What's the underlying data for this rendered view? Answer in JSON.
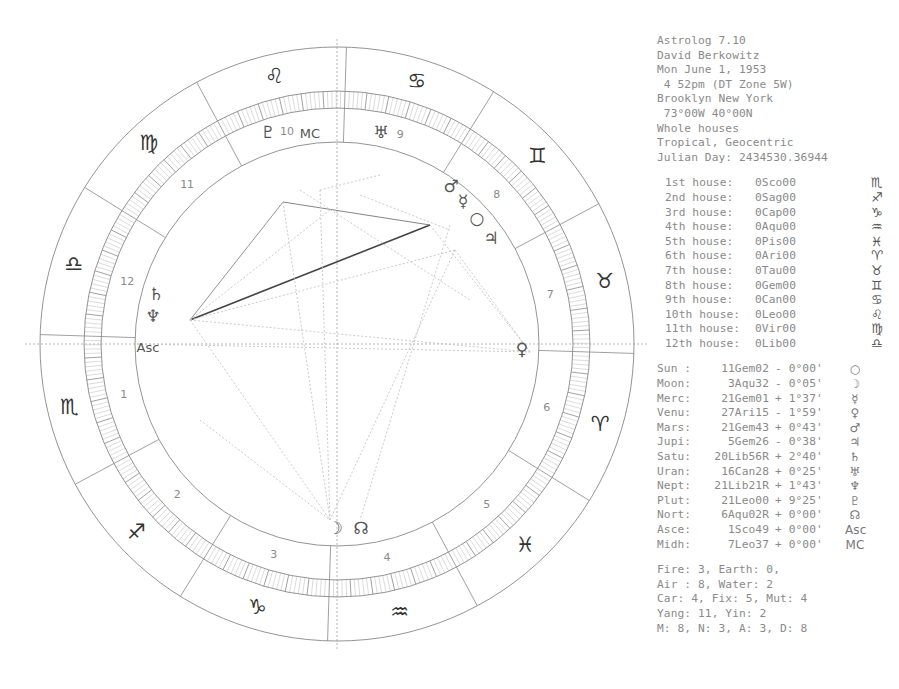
{
  "header": {
    "program": "Astrolog 7.10",
    "name": "David Berkowitz",
    "date": "Mon June 1, 1953",
    "time": " 4 52pm (DT Zone 5W)",
    "place": "Brooklyn New York",
    "coords": " 73°00W 40°00N",
    "house_system": "Whole houses",
    "zodiac": "Tropical, Geocentric",
    "julian_day": "Julian Day: 2434530.36944"
  },
  "houses": [
    {
      "label": "1st house:",
      "cusp": "0Sco00",
      "glyph": "♏"
    },
    {
      "label": "2nd house:",
      "cusp": "0Sag00",
      "glyph": "♐"
    },
    {
      "label": "3rd house:",
      "cusp": "0Cap00",
      "glyph": "♑"
    },
    {
      "label": "4th house:",
      "cusp": "0Aqu00",
      "glyph": "♒"
    },
    {
      "label": "5th house:",
      "cusp": "0Pis00",
      "glyph": "♓"
    },
    {
      "label": "6th house:",
      "cusp": "0Ari00",
      "glyph": "♈"
    },
    {
      "label": "7th house:",
      "cusp": "0Tau00",
      "glyph": "♉"
    },
    {
      "label": "8th house:",
      "cusp": "0Gem00",
      "glyph": "♊"
    },
    {
      "label": "9th house:",
      "cusp": "0Can00",
      "glyph": "♋"
    },
    {
      "label": "10th house:",
      "cusp": "0Leo00",
      "glyph": "♌"
    },
    {
      "label": "11th house:",
      "cusp": "0Vir00",
      "glyph": "♍"
    },
    {
      "label": "12th house:",
      "cusp": "0Lib00",
      "glyph": "♎"
    }
  ],
  "planets": [
    {
      "name": "Sun :",
      "pos": "11Gem02",
      "lat": "- 0°00'",
      "glyph": "○",
      "lon": 71.03
    },
    {
      "name": "Moon:",
      "pos": "3Aqu32",
      "lat": "- 0°05'",
      "glyph": "☽",
      "lon": 303.53
    },
    {
      "name": "Merc:",
      "pos": "21Gem01",
      "lat": "+ 1°37'",
      "glyph": "☿",
      "lon": 81.02
    },
    {
      "name": "Venu:",
      "pos": "27Ari15",
      "lat": "- 1°59'",
      "glyph": "♀",
      "lon": 27.25
    },
    {
      "name": "Mars:",
      "pos": "21Gem43",
      "lat": "+ 0°43'",
      "glyph": "♂",
      "lon": 81.72
    },
    {
      "name": "Jupi:",
      "pos": "5Gem26",
      "lat": "- 0°38'",
      "glyph": "♃",
      "lon": 65.43
    },
    {
      "name": "Satu:",
      "pos": "20Lib56R",
      "lat": "+ 2°40'",
      "glyph": "♄",
      "lon": 200.93
    },
    {
      "name": "Uran:",
      "pos": "16Can28",
      "lat": "+ 0°25'",
      "glyph": "♅",
      "lon": 106.47
    },
    {
      "name": "Nept:",
      "pos": "21Lib21R",
      "lat": "+ 1°43'",
      "glyph": "♆",
      "lon": 201.35
    },
    {
      "name": "Plut:",
      "pos": "21Leo00",
      "lat": "+ 9°25'",
      "glyph": "♇",
      "lon": 141.0
    },
    {
      "name": "Nort:",
      "pos": "6Aqu02R",
      "lat": "+ 0°00'",
      "glyph": "☊",
      "lon": 306.03
    },
    {
      "name": "Asce:",
      "pos": "1Sco49",
      "lat": "+ 0°00'",
      "glyph": "Asc",
      "lon": 211.82
    },
    {
      "name": "Midh:",
      "pos": "7Leo37",
      "lat": "+ 0°00'",
      "glyph": "MC",
      "lon": 127.62
    }
  ],
  "summary": [
    "Fire: 3, Earth: 0,",
    "Air : 8, Water: 2",
    "Car: 4, Fix: 5, Mut: 4",
    "Yang: 11, Yin: 2",
    "M: 8, N: 3, A: 3, D: 8"
  ],
  "wheel": {
    "center": [
      337,
      344
    ],
    "ascendant_lon": 211.82,
    "radii": {
      "outer": 297,
      "band_outer": 253,
      "band_inner": 236,
      "inner": 202
    },
    "signs": [
      "♈",
      "♉",
      "♊",
      "♋",
      "♌",
      "♍",
      "♎",
      "♏",
      "♐",
      "♑",
      "♒",
      "♓"
    ],
    "house_numbers": [
      "1",
      "2",
      "3",
      "4",
      "5",
      "6",
      "7",
      "8",
      "9",
      "10",
      "11",
      "12"
    ],
    "chart_glyphs": [
      {
        "glyph": "♇",
        "x": 268,
        "y": 138
      },
      {
        "glyph": "MC",
        "x": 310,
        "y": 138
      },
      {
        "glyph": "♅",
        "x": 381,
        "y": 138
      },
      {
        "glyph": "♂",
        "x": 451,
        "y": 192
      },
      {
        "glyph": "☿",
        "x": 463,
        "y": 207
      },
      {
        "glyph": "○",
        "x": 477,
        "y": 224
      },
      {
        "glyph": "♃",
        "x": 491,
        "y": 244
      },
      {
        "glyph": "♄",
        "x": 156,
        "y": 300
      },
      {
        "glyph": "♆",
        "x": 153,
        "y": 322
      },
      {
        "glyph": "Asc",
        "x": 148,
        "y": 352
      },
      {
        "glyph": "♀",
        "x": 522,
        "y": 355
      },
      {
        "glyph": "☽",
        "x": 335,
        "y": 534
      },
      {
        "glyph": "☊",
        "x": 361,
        "y": 534
      }
    ],
    "aspect_points": {
      "pluto": [
        283,
        202
      ],
      "mars_cluster": [
        430,
        225
      ],
      "saturn_neptune": [
        190,
        320
      ]
    },
    "colors": {
      "line": "#888888",
      "dark": "#555555",
      "band": "#b8b8b8",
      "dotted": "#c4c4c4"
    }
  }
}
